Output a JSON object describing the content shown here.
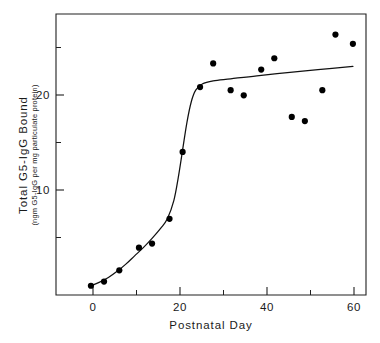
{
  "chart_data": {
    "type": "scatter",
    "title": "",
    "xlabel": "Postnatal Day",
    "ylabel": "Total G5-IgG Bound",
    "ylabel_units": "(ngm G5-IgG per mg particulate protein)",
    "xlim": [
      -8,
      63
    ],
    "ylim": [
      -0.8,
      26.5
    ],
    "xticks": [
      0,
      20,
      40,
      60
    ],
    "xtick_labels": [
      "0",
      "20",
      "40",
      "60"
    ],
    "xticks_minor": [
      10,
      30,
      50
    ],
    "yticks": [
      10,
      20
    ],
    "ytick_labels": [
      "10",
      "20"
    ],
    "grid": false,
    "legend": false,
    "legend_position": "none",
    "marker": "filled-circle",
    "marker_color": "#000000",
    "curve_color": "#111111",
    "series": [
      {
        "name": "Total G5-IgG Bound",
        "points": [
          {
            "x": 0.0,
            "y": 0.1
          },
          {
            "x": 3.0,
            "y": 0.5
          },
          {
            "x": 6.5,
            "y": 1.6
          },
          {
            "x": 11.0,
            "y": 3.8
          },
          {
            "x": 14.0,
            "y": 4.2
          },
          {
            "x": 18.0,
            "y": 6.6
          },
          {
            "x": 21.0,
            "y": 13.1
          },
          {
            "x": 25.0,
            "y": 19.4
          },
          {
            "x": 28.0,
            "y": 21.7
          },
          {
            "x": 32.0,
            "y": 19.1
          },
          {
            "x": 35.0,
            "y": 18.6
          },
          {
            "x": 39.0,
            "y": 21.1
          },
          {
            "x": 42.0,
            "y": 22.2
          },
          {
            "x": 46.0,
            "y": 16.5
          },
          {
            "x": 49.0,
            "y": 16.1
          },
          {
            "x": 53.0,
            "y": 19.1
          },
          {
            "x": 56.0,
            "y": 24.5
          },
          {
            "x": 60.0,
            "y": 23.6
          }
        ]
      }
    ],
    "fit_curve": {
      "name": "sigmoid fit",
      "points": [
        {
          "x": 0.0,
          "y": 0.1
        },
        {
          "x": 2.0,
          "y": 0.45
        },
        {
          "x": 4.0,
          "y": 0.9
        },
        {
          "x": 6.0,
          "y": 1.5
        },
        {
          "x": 8.0,
          "y": 2.2
        },
        {
          "x": 10.0,
          "y": 3.0
        },
        {
          "x": 12.0,
          "y": 3.8
        },
        {
          "x": 14.0,
          "y": 4.7
        },
        {
          "x": 16.0,
          "y": 5.7
        },
        {
          "x": 17.5,
          "y": 6.6
        },
        {
          "x": 19.0,
          "y": 8.4
        },
        {
          "x": 20.0,
          "y": 10.6
        },
        {
          "x": 21.0,
          "y": 13.3
        },
        {
          "x": 22.0,
          "y": 16.0
        },
        {
          "x": 23.0,
          "y": 18.0
        },
        {
          "x": 24.0,
          "y": 19.1
        },
        {
          "x": 25.5,
          "y": 19.7
        },
        {
          "x": 28.0,
          "y": 20.0
        },
        {
          "x": 32.0,
          "y": 20.2
        },
        {
          "x": 38.0,
          "y": 20.5
        },
        {
          "x": 45.0,
          "y": 20.8
        },
        {
          "x": 52.0,
          "y": 21.1
        },
        {
          "x": 60.0,
          "y": 21.4
        }
      ]
    }
  },
  "axes": {
    "x_axis_label": "Postnatal Day",
    "y_axis_label_main": "Total G5-IgG Bound",
    "y_axis_label_units": "(ngm G5-IgG per mg particulate protein)",
    "x_tick_0": "0",
    "x_tick_1": "20",
    "x_tick_2": "40",
    "x_tick_3": "60",
    "y_tick_0": "10",
    "y_tick_1": "20"
  }
}
